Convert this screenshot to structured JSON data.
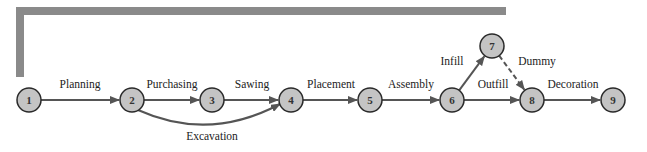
{
  "diagram": {
    "type": "activity-on-arrow network",
    "colors": {
      "node_fill": "#c4c4c4",
      "node_stroke": "#2a2a2a",
      "edge": "#555555",
      "frame": "#8a8a8a"
    },
    "nodes": [
      {
        "id": "1",
        "label": "1",
        "x": 29,
        "y": 100
      },
      {
        "id": "2",
        "label": "2",
        "x": 132,
        "y": 100
      },
      {
        "id": "3",
        "label": "3",
        "x": 212,
        "y": 100
      },
      {
        "id": "4",
        "label": "4",
        "x": 291,
        "y": 100
      },
      {
        "id": "5",
        "label": "5",
        "x": 370,
        "y": 100
      },
      {
        "id": "6",
        "label": "6",
        "x": 452,
        "y": 100
      },
      {
        "id": "7",
        "label": "7",
        "x": 492,
        "y": 46
      },
      {
        "id": "8",
        "label": "8",
        "x": 532,
        "y": 100
      },
      {
        "id": "9",
        "label": "9",
        "x": 613,
        "y": 100
      }
    ],
    "edges": [
      {
        "from": "1",
        "to": "2",
        "label": "Planning",
        "style": "solid"
      },
      {
        "from": "2",
        "to": "3",
        "label": "Purchasing",
        "style": "solid"
      },
      {
        "from": "3",
        "to": "4",
        "label": "Sawing",
        "style": "solid"
      },
      {
        "from": "2",
        "to": "4",
        "label": "Excavation",
        "style": "solid-curved"
      },
      {
        "from": "4",
        "to": "5",
        "label": "Placement",
        "style": "solid"
      },
      {
        "from": "5",
        "to": "6",
        "label": "Assembly",
        "style": "solid"
      },
      {
        "from": "6",
        "to": "7",
        "label": "Infill",
        "style": "solid"
      },
      {
        "from": "6",
        "to": "8",
        "label": "Outfill",
        "style": "solid"
      },
      {
        "from": "7",
        "to": "8",
        "label": "Dummy",
        "style": "dashed"
      },
      {
        "from": "8",
        "to": "9",
        "label": "Decoration",
        "style": "solid"
      }
    ]
  }
}
